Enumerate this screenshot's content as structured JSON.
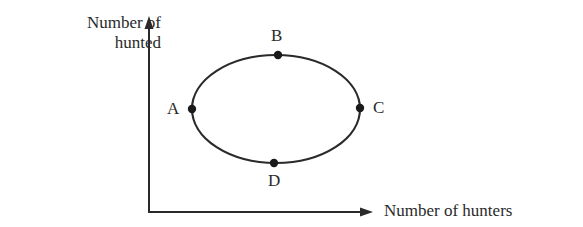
{
  "diagram": {
    "type": "cycle",
    "y_axis_label_line1": "Number of",
    "y_axis_label_line2": "hunted",
    "x_axis_label": "Number of hunters",
    "points": [
      {
        "label": "A",
        "position": "left"
      },
      {
        "label": "B",
        "position": "top"
      },
      {
        "label": "C",
        "position": "right"
      },
      {
        "label": "D",
        "position": "bottom"
      }
    ],
    "stroke_color": "#2a2a2a"
  }
}
